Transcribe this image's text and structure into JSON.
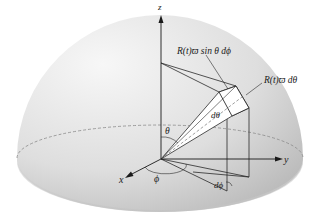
{
  "diagram": {
    "axes": {
      "x_label": "x",
      "y_label": "y",
      "z_label": "z"
    },
    "labels": {
      "top_annotation": "R(t)ϖ sin θ dϕ",
      "right_annotation": "R(t)ϖ dθ",
      "d_theta": "dθ",
      "theta": "θ",
      "phi": "ϕ",
      "d_phi": "dϕ"
    },
    "colors": {
      "hemisphere_light": "#f4f4f4",
      "hemisphere_dark": "#b8b8b8",
      "line": "#2a2a2a",
      "dashed": "#888888"
    }
  }
}
